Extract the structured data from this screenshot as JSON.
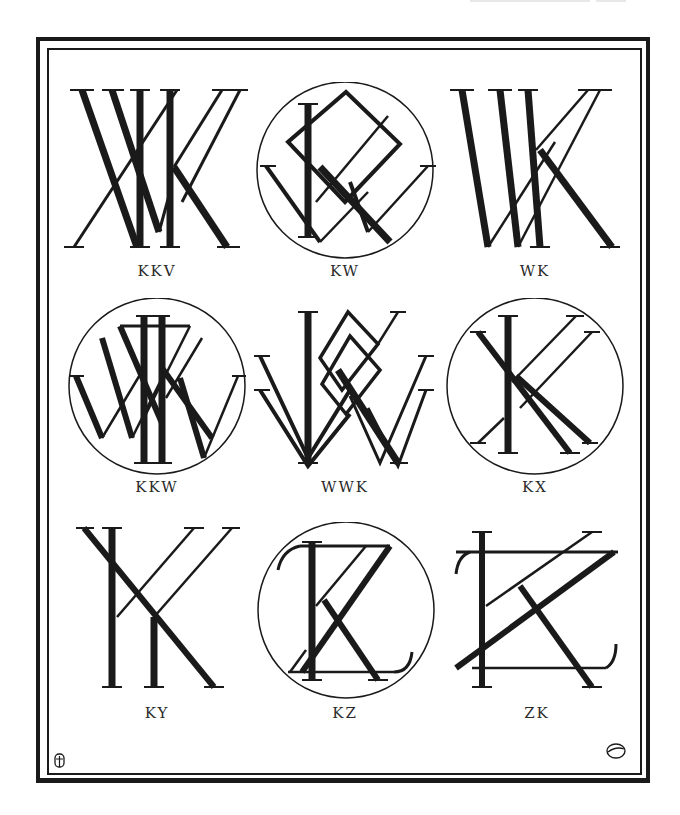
{
  "page": {
    "type": "monogram-plate",
    "ink_color": "#1a1a1a",
    "paper_color": "#ffffff"
  },
  "monograms": [
    {
      "label": "KKV",
      "encircled": false
    },
    {
      "label": "KW",
      "encircled": true
    },
    {
      "label": "WK",
      "encircled": false
    },
    {
      "label": "KKW",
      "encircled": true
    },
    {
      "label": "WWK",
      "encircled": false
    },
    {
      "label": "KX",
      "encircled": true
    },
    {
      "label": "KY",
      "encircled": false
    },
    {
      "label": "KZ",
      "encircled": true
    },
    {
      "label": "ZK",
      "encircled": false
    }
  ],
  "corner_marks": {
    "bottom_left": "artist-monogram-mark",
    "bottom_right": "circled-6-mark"
  }
}
